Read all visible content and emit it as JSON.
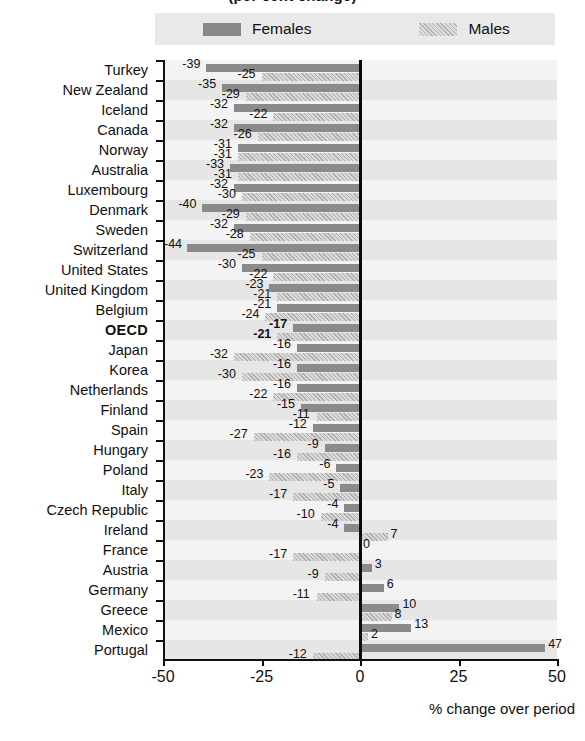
{
  "title_partial": "(per cent change)",
  "legend": {
    "items": [
      {
        "key": "females",
        "label": "Females",
        "swatch": "solid-dark-gray",
        "color": "#8a8a8a"
      },
      {
        "key": "males",
        "label": "Males",
        "swatch": "hatched-light-gray",
        "color": "#c9c9c9"
      }
    ]
  },
  "axis": {
    "x_title": "% change over period",
    "x_ticks": [
      "-50",
      "-25",
      "0",
      "25",
      "50"
    ],
    "x_tick_values": [
      -50,
      -25,
      0,
      25,
      50
    ]
  },
  "chart_data": {
    "type": "bar",
    "orientation": "horizontal",
    "title": "(per cent change)",
    "xlabel": "% change over period",
    "ylabel": "",
    "xlim": [
      -50,
      50
    ],
    "grid": false,
    "legend_position": "top",
    "categories": [
      "Turkey",
      "New Zealand",
      "Iceland",
      "Canada",
      "Norway",
      "Australia",
      "Luxembourg",
      "Denmark",
      "Sweden",
      "Switzerland",
      "United States",
      "United Kingdom",
      "Belgium",
      "OECD",
      "Japan",
      "Korea",
      "Netherlands",
      "Finland",
      "Spain",
      "Hungary",
      "Poland",
      "Italy",
      "Czech Republic",
      "Ireland",
      "France",
      "Austria",
      "Germany",
      "Greece",
      "Mexico",
      "Portugal"
    ],
    "highlight_category": "OECD",
    "series": [
      {
        "name": "Females",
        "values": [
          -39,
          -35,
          -32,
          -32,
          -31,
          -33,
          -32,
          -40,
          -32,
          -44,
          -30,
          -23,
          -21,
          -17,
          -16,
          -16,
          -16,
          -15,
          -12,
          -9,
          -6,
          -5,
          -4,
          -4,
          0,
          3,
          6,
          10,
          13,
          47
        ]
      },
      {
        "name": "Males",
        "values": [
          -25,
          -29,
          -22,
          -26,
          -31,
          -31,
          -30,
          -29,
          -28,
          -25,
          -22,
          -21,
          -24,
          -21,
          -32,
          -30,
          -22,
          -11,
          -27,
          -16,
          -23,
          -17,
          -10,
          7,
          -17,
          -9,
          -11,
          8,
          2,
          -12
        ]
      }
    ]
  }
}
